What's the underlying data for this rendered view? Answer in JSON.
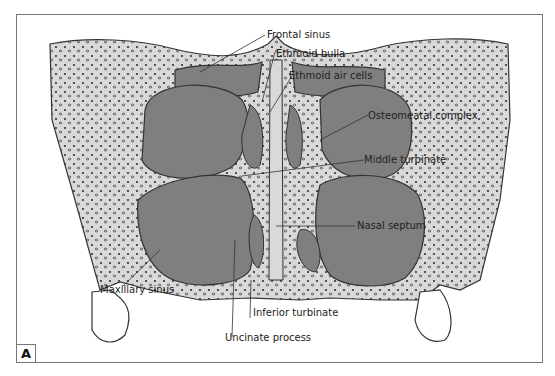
{
  "figure": {
    "panel_label": "A",
    "colors": {
      "sinus_fill": "#7f7f7f",
      "bone_fill": "#d9d9d9",
      "outline": "#333333",
      "frame": "#777777"
    },
    "labels": [
      {
        "id": "frontal-sinus",
        "text": "Frontal sinus"
      },
      {
        "id": "ethmoid-bulla",
        "text": "Ethmoid bulla"
      },
      {
        "id": "ethmoid-air-cells",
        "text": "Ethmoid air cells"
      },
      {
        "id": "osteomeatal-complex",
        "text": "Osteomeatal complex"
      },
      {
        "id": "middle-turbinate",
        "text": "Middle turbinate"
      },
      {
        "id": "nasal-septum",
        "text": "Nasal septum"
      },
      {
        "id": "maxillary-sinus",
        "text": "Maxillary sinus"
      },
      {
        "id": "inferior-turbinate",
        "text": "Inferior turbinate"
      },
      {
        "id": "uncinate-process",
        "text": "Uncinate process"
      }
    ]
  }
}
